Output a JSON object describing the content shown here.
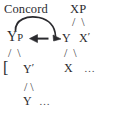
{
  "figure": {
    "background_color": "#ffffff",
    "ink_color": "#2a2a2e",
    "width": 128,
    "height": 114
  },
  "annotations": {
    "concord_label": "Concord"
  },
  "tree": {
    "row1": {
      "xp": "XP"
    },
    "row2": {
      "yp_head": "Y",
      "yp_subscript": "P",
      "y": "Y",
      "x_bar_base": "X",
      "x_bar_prime": "′"
    },
    "row3": {
      "bracket": "[",
      "y_bar_base": "Y",
      "y_bar_prime": "′",
      "x": "X",
      "ellipsis": "…"
    },
    "row4": {
      "y_leaf": "Y",
      "ellipsis": "…"
    },
    "branches": {
      "under_xp": "/  \\",
      "under_yp": "/  \\",
      "under_x_bar": "/  \\",
      "under_y_bar": "/ \\"
    }
  },
  "arrows": {
    "concord_arc_name": "concord-agreement-arc",
    "left_arrow_name": "leftward-agreement-arrow",
    "stroke_color": "#2a2a2e"
  }
}
